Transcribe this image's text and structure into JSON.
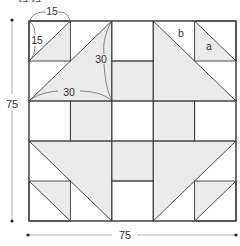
{
  "header": {
    "text": "ほほ"
  },
  "diagram": {
    "grid": {
      "rows": 5,
      "cols": 5
    },
    "colors": {
      "shade": "#ebebeb",
      "line": "#3a3a3a",
      "dim": "#555555",
      "background": "#ffffff"
    },
    "labels": {
      "cell_width": "15",
      "cell_height": "15",
      "big_triangle_side_vertical": "30",
      "big_triangle_side_horizontal": "30",
      "piece_b": "b",
      "piece_a": "a",
      "total_height": "75",
      "total_width": "75"
    },
    "shaded_cells": [
      [
        1,
        2
      ],
      [
        2,
        1
      ],
      [
        2,
        3
      ],
      [
        3,
        2
      ]
    ],
    "half_square_triangles": [
      {
        "name": "top-left-small",
        "cell": [
          0,
          0
        ],
        "span": 1,
        "shaded": "lower-right"
      },
      {
        "name": "top-left-large",
        "cell": [
          0,
          0
        ],
        "span": 2,
        "shaded": "lower-right"
      },
      {
        "name": "top-right-small",
        "cell": [
          0,
          4
        ],
        "span": 1,
        "shaded": "lower-left"
      },
      {
        "name": "top-right-large",
        "cell": [
          0,
          3
        ],
        "span": 2,
        "shaded": "lower-left"
      },
      {
        "name": "bottom-left-small",
        "cell": [
          4,
          0
        ],
        "span": 1,
        "shaded": "upper-right"
      },
      {
        "name": "bottom-left-large",
        "cell": [
          3,
          0
        ],
        "span": 2,
        "shaded": "upper-right"
      },
      {
        "name": "bottom-right-small",
        "cell": [
          4,
          4
        ],
        "span": 1,
        "shaded": "upper-left"
      },
      {
        "name": "bottom-right-large",
        "cell": [
          3,
          3
        ],
        "span": 2,
        "shaded": "upper-left"
      }
    ]
  }
}
